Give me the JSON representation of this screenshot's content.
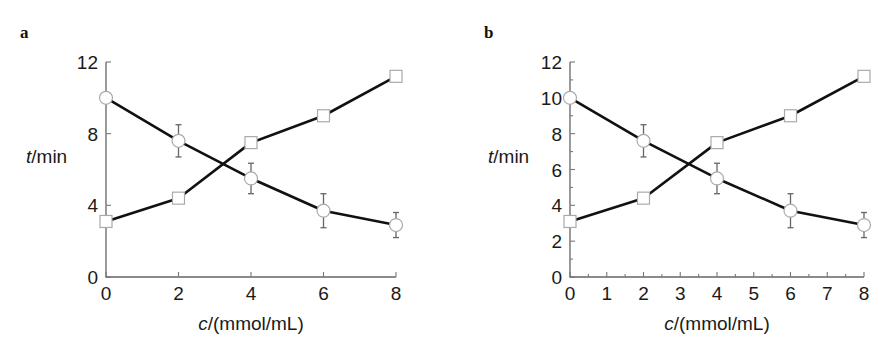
{
  "chart_data": [
    {
      "type": "line",
      "panel": "a",
      "title": "",
      "xlabel_italic": "c",
      "xlabel_rest": "/(mmol/mL)",
      "ylabel_italic": "t",
      "ylabel_rest": "/min",
      "xlim": [
        0,
        8
      ],
      "ylim": [
        0,
        12
      ],
      "xticks": [
        0,
        2,
        4,
        6,
        8
      ],
      "yticks": [
        0,
        4,
        8,
        12
      ],
      "x_minor_ticks": [],
      "y_minor_ticks": [],
      "grid": false,
      "legend": "none",
      "x": [
        0,
        2,
        4,
        6,
        8
      ],
      "series": [
        {
          "name": "circles",
          "marker": "circle",
          "values": [
            10.0,
            7.6,
            5.5,
            3.7,
            2.9
          ],
          "error": [
            0,
            0.9,
            0.85,
            0.95,
            0.7
          ]
        },
        {
          "name": "squares",
          "marker": "square",
          "values": [
            3.1,
            4.4,
            7.5,
            9.0,
            11.2
          ],
          "error": [
            0,
            0,
            0,
            0,
            0
          ]
        }
      ]
    },
    {
      "type": "line",
      "panel": "b",
      "title": "",
      "xlabel_italic": "c",
      "xlabel_rest": "/(mmol/mL)",
      "ylabel_italic": "t",
      "ylabel_rest": "/min",
      "xlim": [
        0,
        8
      ],
      "ylim": [
        0,
        12
      ],
      "xticks": [
        0,
        1,
        2,
        3,
        4,
        5,
        6,
        7,
        8
      ],
      "yticks": [
        0,
        2,
        4,
        6,
        8,
        10,
        12
      ],
      "x_minor_ticks": [
        0.5,
        1.5,
        2.5,
        3.5,
        4.5,
        5.5,
        6.5,
        7.5
      ],
      "y_minor_ticks": [
        1,
        3,
        5,
        7,
        9,
        11
      ],
      "grid": false,
      "legend": "none",
      "x": [
        0,
        2,
        4,
        6,
        8
      ],
      "series": [
        {
          "name": "circles",
          "marker": "circle",
          "values": [
            10.0,
            7.6,
            5.5,
            3.7,
            2.9
          ],
          "error": [
            0,
            0.9,
            0.85,
            0.95,
            0.7
          ]
        },
        {
          "name": "squares",
          "marker": "square",
          "values": [
            3.1,
            4.4,
            7.5,
            9.0,
            11.2
          ],
          "error": [
            0,
            0,
            0,
            0,
            0
          ]
        }
      ]
    }
  ],
  "layout": {
    "panels": [
      {
        "label": "a",
        "label_x": 20,
        "label_y": 38,
        "x0": 106,
        "x1": 396,
        "y0": 277,
        "y1": 62,
        "ylabel_x": 26,
        "ylabel_y": 163,
        "xlabel_cx": 251,
        "xlabel_y": 330,
        "tick_len": 5
      },
      {
        "label": "b",
        "label_x": 484,
        "label_y": 38,
        "x0": 570,
        "x1": 864,
        "y0": 277,
        "y1": 62,
        "ylabel_x": 488,
        "ylabel_y": 163,
        "xlabel_cx": 717,
        "xlabel_y": 330,
        "tick_len": 5
      }
    ]
  }
}
